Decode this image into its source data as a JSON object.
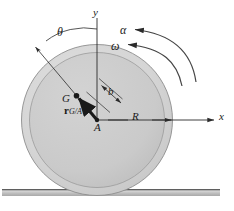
{
  "figure": {
    "labels": {
      "y_axis": "y",
      "x_axis": "x",
      "theta": "θ",
      "alpha": "α",
      "omega": "ω",
      "offset_b": "b",
      "center_of_mass": "G",
      "contact_point": "A",
      "radius": "R",
      "relative_position_prefix": "r",
      "relative_position_sub": "G/A"
    },
    "colors": {
      "background": "#ffffff",
      "disk_outer_fill": "#d4d4d4",
      "disk_inner_fill": "#c9c9c9",
      "disk_stroke": "#8f8f8f",
      "ground_top": "#6e6e6e",
      "ground_fill": "#b9b9b9",
      "line": "#2b2b2b",
      "text": "#1a1a1a"
    },
    "geometry": {
      "disk_center_x": 97,
      "disk_center_y": 120,
      "disk_outer_radius": 76,
      "disk_inner_radius": 68,
      "ground_y": 190,
      "x_axis_end": 216,
      "y_axis_top": 18,
      "theta_arrow_tip_x": 35,
      "theta_arrow_tip_y": 47
    }
  }
}
